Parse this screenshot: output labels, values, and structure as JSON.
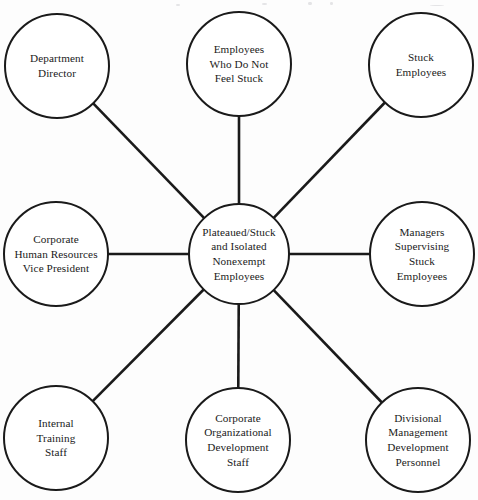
{
  "diagram": {
    "type": "hub-and-spoke",
    "title": "",
    "center": {
      "id": "center-node",
      "label": "Plateaued/Stuck\nand Isolated\nNonexempt\nEmployees",
      "lines": [
        "Plateaued/Stuck",
        "and Isolated",
        "Nonexempt",
        "Employees"
      ],
      "cx": 239,
      "cy": 254,
      "r": 50
    },
    "style": {
      "stroke_color": "#1a1a1a",
      "circle_stroke_width": 2,
      "connector_stroke_width": 2.6,
      "fill_color": "#ffffff",
      "background": "#fdfdfd"
    },
    "nodes": [
      {
        "id": "department-director",
        "label": "Department\nDirector",
        "lines": [
          "Department",
          "Director"
        ],
        "cx": 57,
        "cy": 66,
        "r": 52,
        "position": "top-left"
      },
      {
        "id": "employees-who-do-not-feel-stuck",
        "label": "Employees\nWho Do Not\nFeel Stuck",
        "lines": [
          "Employees",
          "Who Do Not",
          "Feel Stuck"
        ],
        "cx": 239,
        "cy": 64,
        "r": 52,
        "position": "top-center"
      },
      {
        "id": "stuck-employees",
        "label": "Stuck\nEmployees",
        "lines": [
          "Stuck",
          "Employees"
        ],
        "cx": 421,
        "cy": 65,
        "r": 52,
        "position": "top-right"
      },
      {
        "id": "corporate-human-resources-vice-president",
        "label": "Corporate\nHuman Resources\nVice President",
        "lines": [
          "Corporate",
          "Human Resources",
          "Vice President"
        ],
        "cx": 56,
        "cy": 254,
        "r": 52,
        "position": "middle-left"
      },
      {
        "id": "managers-supervising-stuck-employees",
        "label": "Managers\nSupervising\nStuck\nEmployees",
        "lines": [
          "Managers",
          "Supervising",
          "Stuck",
          "Employees"
        ],
        "cx": 422,
        "cy": 254,
        "r": 52,
        "position": "middle-right"
      },
      {
        "id": "internal-training-staff",
        "label": "Internal\nTraining\nStaff",
        "lines": [
          "Internal",
          "Training",
          "Staff"
        ],
        "cx": 56,
        "cy": 438,
        "r": 52,
        "position": "bottom-left"
      },
      {
        "id": "corporate-organizational-development-staff",
        "label": "Corporate\nOrganizational\nDevelopment\nStaff",
        "lines": [
          "Corporate",
          "Organizational",
          "Development",
          "Staff"
        ],
        "cx": 238,
        "cy": 440,
        "r": 52,
        "position": "bottom-center"
      },
      {
        "id": "divisional-management-development-personnel",
        "label": "Divisional\nManagement\nDevelopment\nPersonnel",
        "lines": [
          "Divisional",
          "Management",
          "Development",
          "Personnel"
        ],
        "cx": 418,
        "cy": 440,
        "r": 52,
        "position": "bottom-right"
      }
    ],
    "connections": [
      {
        "from": "center-node",
        "to": "department-director"
      },
      {
        "from": "center-node",
        "to": "employees-who-do-not-feel-stuck"
      },
      {
        "from": "center-node",
        "to": "stuck-employees"
      },
      {
        "from": "center-node",
        "to": "corporate-human-resources-vice-president"
      },
      {
        "from": "center-node",
        "to": "managers-supervising-stuck-employees"
      },
      {
        "from": "center-node",
        "to": "internal-training-staff"
      },
      {
        "from": "center-node",
        "to": "corporate-organizational-development-staff"
      },
      {
        "from": "center-node",
        "to": "divisional-management-development-personnel"
      }
    ]
  }
}
